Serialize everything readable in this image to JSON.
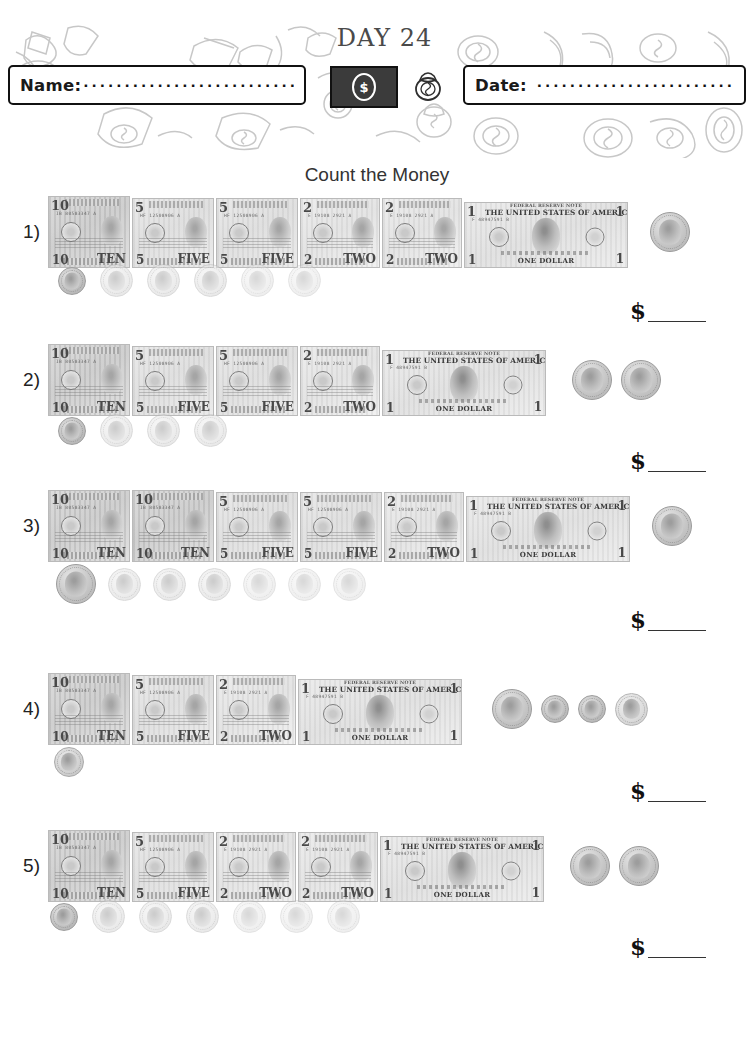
{
  "header": {
    "name_label": "Name:",
    "name_value": "",
    "name_dots": "·····································",
    "date_label": "Date:",
    "date_value": "",
    "date_dots": "··························",
    "day_label": "DAY 24",
    "bill_icon_symbol": "$",
    "bag_icon_symbol": "$",
    "background": "money-doodle-pattern"
  },
  "title": "Count the Money",
  "answer_prefix": "$",
  "answer_value": "",
  "colors": {
    "ink": "#1a1a1a",
    "title": "#333333",
    "day_text": "#4a4a4a",
    "bill_dark": "#3b3b3b",
    "line": "#333333"
  },
  "problems": [
    {
      "number": "1)",
      "bills": [
        {
          "denomination": "10",
          "corner_tl": "10",
          "corner_bl": "10",
          "corner_tr": "10",
          "corner_br": "TEN",
          "serial": "IB 80583347 A"
        },
        {
          "denomination": "5",
          "corner_tl": "5",
          "corner_bl": "5",
          "corner_tr": "5",
          "corner_br": "FIVE",
          "serial": "HF 12508906 A"
        },
        {
          "denomination": "5",
          "corner_tl": "5",
          "corner_bl": "5",
          "corner_tr": "5",
          "corner_br": "FIVE",
          "serial": "HF 12508906 A"
        },
        {
          "denomination": "2",
          "corner_tl": "2",
          "corner_bl": "2",
          "corner_tr": "2",
          "corner_br": "TWO",
          "serial": "E 19108 2921 A"
        },
        {
          "denomination": "2",
          "corner_tl": "2",
          "corner_bl": "2",
          "corner_tr": "2",
          "corner_br": "TWO",
          "serial": "E 19108 2921 A"
        },
        {
          "denomination": "1",
          "corner_tl": "1",
          "corner_bl": "1",
          "corner_tr": "1",
          "corner_br": "1",
          "banner_top": "FEDERAL RESERVE NOTE",
          "banner_main": "THE UNITED STATES OF AMERICA",
          "footer": "ONE DOLLAR",
          "serial": "F 48947591 B"
        }
      ],
      "right_coins": [
        {
          "type": "quarter",
          "value": "0.25"
        }
      ],
      "coin_row": [
        {
          "type": "dime",
          "value": "0.10"
        },
        {
          "type": "nickel",
          "value": "0.05"
        },
        {
          "type": "nickel",
          "value": "0.05"
        },
        {
          "type": "nickel",
          "value": "0.05"
        },
        {
          "type": "nickel",
          "value": "0.05"
        },
        {
          "type": "nickel",
          "value": "0.05"
        }
      ]
    },
    {
      "number": "2)",
      "bills": [
        {
          "denomination": "10",
          "corner_tl": "10",
          "corner_bl": "10",
          "corner_tr": "10",
          "corner_br": "TEN",
          "serial": "IB 80583347 A"
        },
        {
          "denomination": "5",
          "corner_tl": "5",
          "corner_bl": "5",
          "corner_tr": "5",
          "corner_br": "FIVE",
          "serial": "HF 12508906 A"
        },
        {
          "denomination": "5",
          "corner_tl": "5",
          "corner_bl": "5",
          "corner_tr": "5",
          "corner_br": "FIVE",
          "serial": "HF 12508906 A"
        },
        {
          "denomination": "2",
          "corner_tl": "2",
          "corner_bl": "2",
          "corner_tr": "2",
          "corner_br": "TWO",
          "serial": "E 19108 2921 A"
        },
        {
          "denomination": "1",
          "corner_tl": "1",
          "corner_bl": "1",
          "corner_tr": "1",
          "corner_br": "1",
          "banner_top": "FEDERAL RESERVE NOTE",
          "banner_main": "THE UNITED STATES OF AMERICA",
          "footer": "ONE DOLLAR",
          "serial": "F 48947591 B"
        }
      ],
      "right_coins": [
        {
          "type": "quarter",
          "value": "0.25"
        },
        {
          "type": "quarter",
          "value": "0.25"
        }
      ],
      "coin_row": [
        {
          "type": "dime",
          "value": "0.10"
        },
        {
          "type": "nickel",
          "value": "0.05"
        },
        {
          "type": "nickel",
          "value": "0.05"
        },
        {
          "type": "nickel",
          "value": "0.05"
        }
      ]
    },
    {
      "number": "3)",
      "bills": [
        {
          "denomination": "10",
          "corner_tl": "10",
          "corner_bl": "10",
          "corner_tr": "10",
          "corner_br": "TEN",
          "serial": "IB 80583347 A"
        },
        {
          "denomination": "10",
          "corner_tl": "10",
          "corner_bl": "10",
          "corner_tr": "10",
          "corner_br": "TEN",
          "serial": "IB 80583347 A"
        },
        {
          "denomination": "5",
          "corner_tl": "5",
          "corner_bl": "5",
          "corner_tr": "5",
          "corner_br": "FIVE",
          "serial": "HF 12508906 A"
        },
        {
          "denomination": "5",
          "corner_tl": "5",
          "corner_bl": "5",
          "corner_tr": "5",
          "corner_br": "FIVE",
          "serial": "HF 12508906 A"
        },
        {
          "denomination": "2",
          "corner_tl": "2",
          "corner_bl": "2",
          "corner_tr": "2",
          "corner_br": "TWO",
          "serial": "E 19108 2921 A"
        },
        {
          "denomination": "1",
          "corner_tl": "1",
          "corner_bl": "1",
          "corner_tr": "1",
          "corner_br": "1",
          "banner_top": "FEDERAL RESERVE NOTE",
          "banner_main": "THE UNITED STATES OF AMERICA",
          "footer": "ONE DOLLAR",
          "serial": "F 48947591 B"
        }
      ],
      "right_coins": [
        {
          "type": "quarter",
          "value": "0.25"
        }
      ],
      "coin_row": [
        {
          "type": "quarter",
          "value": "0.25"
        },
        {
          "type": "nickel",
          "value": "0.05"
        },
        {
          "type": "nickel",
          "value": "0.05"
        },
        {
          "type": "nickel",
          "value": "0.05"
        },
        {
          "type": "nickel",
          "value": "0.05"
        },
        {
          "type": "nickel",
          "value": "0.05"
        },
        {
          "type": "nickel",
          "value": "0.05"
        }
      ]
    },
    {
      "number": "4)",
      "bills": [
        {
          "denomination": "10",
          "corner_tl": "10",
          "corner_bl": "10",
          "corner_tr": "10",
          "corner_br": "TEN",
          "serial": "IB 80583347 A"
        },
        {
          "denomination": "5",
          "corner_tl": "5",
          "corner_bl": "5",
          "corner_tr": "5",
          "corner_br": "FIVE",
          "serial": "HF 12508906 A"
        },
        {
          "denomination": "2",
          "corner_tl": "2",
          "corner_bl": "2",
          "corner_tr": "2",
          "corner_br": "TWO",
          "serial": "E 19108 2921 A"
        },
        {
          "denomination": "1",
          "corner_tl": "1",
          "corner_bl": "1",
          "corner_tr": "1",
          "corner_br": "1",
          "banner_top": "FEDERAL RESERVE NOTE",
          "banner_main": "THE UNITED STATES OF AMERICA",
          "footer": "ONE DOLLAR",
          "serial": "F 48947591 B"
        }
      ],
      "right_coins": [
        {
          "type": "quarter",
          "value": "0.25"
        },
        {
          "type": "dime",
          "value": "0.10"
        },
        {
          "type": "dime",
          "value": "0.10"
        },
        {
          "type": "nickel",
          "value": "0.05"
        }
      ],
      "coin_row": [
        {
          "type": "penny",
          "value": "0.01"
        }
      ]
    },
    {
      "number": "5)",
      "bills": [
        {
          "denomination": "10",
          "corner_tl": "10",
          "corner_bl": "10",
          "corner_tr": "10",
          "corner_br": "TEN",
          "serial": "IB 80583347 A"
        },
        {
          "denomination": "5",
          "corner_tl": "5",
          "corner_bl": "5",
          "corner_tr": "5",
          "corner_br": "FIVE",
          "serial": "HF 12508906 A"
        },
        {
          "denomination": "2",
          "corner_tl": "2",
          "corner_bl": "2",
          "corner_tr": "2",
          "corner_br": "TWO",
          "serial": "E 19108 2921 A"
        },
        {
          "denomination": "2",
          "corner_tl": "2",
          "corner_bl": "2",
          "corner_tr": "2",
          "corner_br": "TWO",
          "serial": "E 19108 2921 A"
        },
        {
          "denomination": "1",
          "corner_tl": "1",
          "corner_bl": "1",
          "corner_tr": "1",
          "corner_br": "1",
          "banner_top": "FEDERAL RESERVE NOTE",
          "banner_main": "THE UNITED STATES OF AMERICA",
          "footer": "ONE DOLLAR",
          "serial": "F 48947591 B"
        }
      ],
      "right_coins": [
        {
          "type": "quarter",
          "value": "0.25"
        },
        {
          "type": "quarter",
          "value": "0.25"
        }
      ],
      "coin_row": [
        {
          "type": "dime",
          "value": "0.10"
        },
        {
          "type": "nickel",
          "value": "0.05"
        },
        {
          "type": "nickel",
          "value": "0.05"
        },
        {
          "type": "nickel",
          "value": "0.05"
        },
        {
          "type": "nickel",
          "value": "0.05"
        },
        {
          "type": "nickel",
          "value": "0.05"
        },
        {
          "type": "nickel",
          "value": "0.05"
        }
      ]
    }
  ]
}
